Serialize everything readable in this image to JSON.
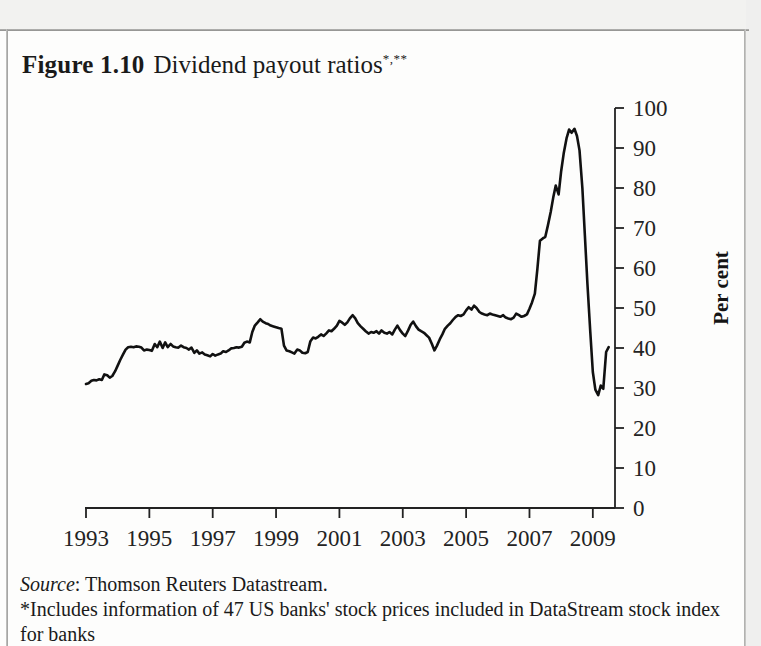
{
  "figure": {
    "label": "Figure 1.10",
    "caption": "Dividend payout ratios",
    "marks": "*,**"
  },
  "footnotes": {
    "source_word": "Source",
    "source_rest": ": Thomson Reuters Datastream.",
    "note_star": "*Includes information of 47 US banks' stock prices included in DataStream stock index for banks"
  },
  "chart_data": {
    "type": "line",
    "title": "Dividend payout ratios",
    "xlabel": "",
    "ylabel": "Per cent",
    "xlim": [
      1993,
      2009.7
    ],
    "ylim": [
      0,
      100
    ],
    "grid": false,
    "legend": "none",
    "line_color": "#111111",
    "xticks": [
      1993,
      1995,
      1997,
      1999,
      2001,
      2003,
      2005,
      2007,
      2009
    ],
    "xtick_labels": [
      "1993",
      "1995",
      "1997",
      "1999",
      "2001",
      "2003",
      "2005",
      "2007",
      "2009"
    ],
    "yticks": [
      0,
      10,
      20,
      30,
      40,
      50,
      60,
      70,
      80,
      90,
      100
    ],
    "ytick_labels": [
      "0",
      "10",
      "20",
      "30",
      "40",
      "50",
      "60",
      "70",
      "80",
      "90",
      "100"
    ],
    "series": [
      {
        "name": "Dividend payout ratio",
        "x": [
          1993.0,
          1993.08,
          1993.17,
          1993.25,
          1993.33,
          1993.42,
          1993.5,
          1993.58,
          1993.67,
          1993.75,
          1993.83,
          1993.92,
          1994.0,
          1994.08,
          1994.17,
          1994.25,
          1994.33,
          1994.42,
          1994.5,
          1994.58,
          1994.67,
          1994.75,
          1994.83,
          1994.92,
          1995.0,
          1995.08,
          1995.17,
          1995.25,
          1995.33,
          1995.42,
          1995.5,
          1995.58,
          1995.67,
          1995.75,
          1995.83,
          1995.92,
          1996.0,
          1996.08,
          1996.17,
          1996.25,
          1996.33,
          1996.42,
          1996.5,
          1996.58,
          1996.67,
          1996.75,
          1996.83,
          1996.92,
          1997.0,
          1997.08,
          1997.17,
          1997.25,
          1997.33,
          1997.42,
          1997.5,
          1997.58,
          1997.67,
          1997.75,
          1997.83,
          1997.92,
          1998.0,
          1998.08,
          1998.17,
          1998.25,
          1998.33,
          1998.42,
          1998.5,
          1998.58,
          1998.67,
          1998.75,
          1998.83,
          1998.92,
          1999.0,
          1999.08,
          1999.17,
          1999.25,
          1999.33,
          1999.42,
          1999.5,
          1999.58,
          1999.67,
          1999.75,
          1999.83,
          1999.92,
          2000.0,
          2000.08,
          2000.17,
          2000.25,
          2000.33,
          2000.42,
          2000.5,
          2000.58,
          2000.67,
          2000.75,
          2000.83,
          2000.92,
          2001.0,
          2001.08,
          2001.17,
          2001.25,
          2001.33,
          2001.42,
          2001.5,
          2001.58,
          2001.67,
          2001.75,
          2001.83,
          2001.92,
          2002.0,
          2002.08,
          2002.17,
          2002.25,
          2002.33,
          2002.42,
          2002.5,
          2002.58,
          2002.67,
          2002.75,
          2002.83,
          2002.92,
          2003.0,
          2003.08,
          2003.17,
          2003.25,
          2003.33,
          2003.42,
          2003.5,
          2003.58,
          2003.67,
          2003.75,
          2003.83,
          2003.92,
          2004.0,
          2004.08,
          2004.17,
          2004.25,
          2004.33,
          2004.42,
          2004.5,
          2004.58,
          2004.67,
          2004.75,
          2004.83,
          2004.92,
          2005.0,
          2005.08,
          2005.17,
          2005.25,
          2005.33,
          2005.42,
          2005.5,
          2005.58,
          2005.67,
          2005.75,
          2005.83,
          2005.92,
          2006.0,
          2006.08,
          2006.17,
          2006.25,
          2006.33,
          2006.42,
          2006.5,
          2006.58,
          2006.67,
          2006.75,
          2006.83,
          2006.92,
          2007.0,
          2007.08,
          2007.17,
          2007.25,
          2007.33,
          2007.42,
          2007.5,
          2007.58,
          2007.67,
          2007.75,
          2007.83,
          2007.92,
          2008.0,
          2008.08,
          2008.17,
          2008.25,
          2008.33,
          2008.42,
          2008.5,
          2008.58,
          2008.67,
          2008.75,
          2008.83,
          2008.92,
          2009.0,
          2009.08,
          2009.17,
          2009.25,
          2009.33,
          2009.42,
          2009.5
        ],
        "values": [
          31.0,
          31.2,
          31.8,
          32.0,
          31.9,
          32.2,
          32.0,
          33.4,
          33.2,
          32.6,
          33.0,
          34.2,
          35.6,
          37.0,
          38.4,
          39.6,
          40.2,
          40.3,
          40.2,
          40.4,
          40.3,
          40.1,
          39.4,
          39.6,
          39.5,
          39.3,
          41.0,
          40.2,
          41.6,
          40.0,
          41.4,
          40.2,
          41.0,
          40.4,
          40.2,
          40.1,
          40.6,
          40.2,
          40.0,
          39.6,
          40.1,
          38.8,
          39.4,
          38.6,
          38.9,
          38.4,
          38.2,
          37.9,
          38.5,
          38.1,
          38.4,
          38.6,
          39.2,
          39.0,
          39.4,
          39.9,
          40.0,
          40.2,
          40.1,
          40.3,
          41.3,
          41.6,
          41.4,
          44.0,
          45.6,
          46.4,
          47.2,
          46.6,
          46.2,
          46.0,
          45.6,
          45.4,
          45.2,
          45.0,
          44.8,
          40.6,
          39.4,
          39.2,
          38.9,
          38.6,
          39.6,
          39.4,
          38.8,
          38.7,
          39.0,
          41.6,
          42.6,
          42.4,
          42.8,
          43.4,
          43.0,
          43.6,
          44.4,
          44.2,
          44.8,
          45.6,
          46.8,
          46.4,
          45.8,
          46.4,
          47.4,
          48.2,
          47.4,
          46.2,
          45.4,
          44.8,
          44.2,
          43.6,
          44.0,
          43.8,
          44.2,
          43.6,
          44.4,
          43.8,
          43.6,
          44.0,
          43.4,
          44.6,
          45.6,
          44.4,
          43.6,
          43.0,
          44.4,
          45.8,
          46.6,
          45.4,
          44.6,
          44.2,
          43.8,
          43.2,
          42.6,
          41.0,
          39.4,
          40.6,
          42.2,
          43.4,
          44.8,
          45.6,
          46.2,
          47.0,
          47.8,
          48.2,
          48.0,
          48.4,
          49.4,
          50.2,
          49.6,
          50.6,
          50.0,
          49.0,
          48.6,
          48.4,
          48.2,
          48.6,
          48.4,
          48.2,
          48.0,
          47.8,
          48.2,
          47.6,
          47.4,
          47.2,
          47.6,
          48.6,
          48.2,
          47.8,
          48.0,
          48.4,
          49.8,
          51.4,
          53.6,
          59.8,
          66.8,
          67.4,
          67.8,
          70.6,
          74.0,
          77.6,
          80.6,
          78.4,
          84.2,
          88.6,
          92.4,
          94.6,
          93.8,
          94.8,
          93.0,
          89.4,
          80.0,
          68.0,
          56.0,
          44.0,
          34.0,
          29.6,
          28.2,
          30.6,
          29.8,
          39.0,
          40.2
        ]
      }
    ]
  }
}
